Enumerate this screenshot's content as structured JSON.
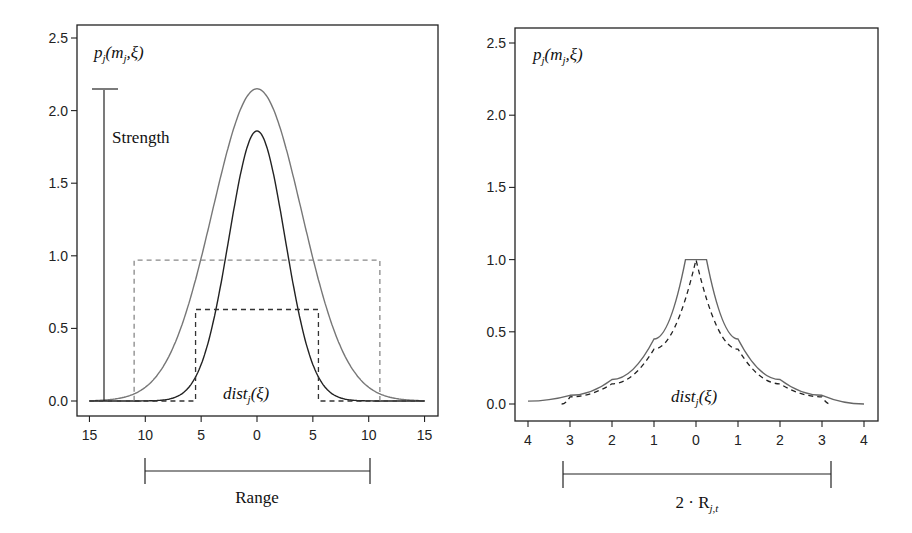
{
  "chart_data": [
    {
      "type": "line",
      "panel": "left",
      "title": "",
      "xlabel": "Range",
      "ylabel": "",
      "x_tick_labels": [
        "15",
        "10",
        "5",
        "0",
        "5",
        "10",
        "15"
      ],
      "x_ticks": [
        -15,
        -10,
        -5,
        0,
        5,
        10,
        15
      ],
      "y_tick_labels": [
        "0.0",
        "0.5",
        "1.0",
        "1.5",
        "2.0",
        "2.5"
      ],
      "y_ticks": [
        0.0,
        0.5,
        1.0,
        1.5,
        2.0,
        2.5
      ],
      "xlim": [
        -15,
        15
      ],
      "ylim": [
        -0.1,
        2.6
      ],
      "grid": false,
      "annotations": {
        "corner_label": "p_j(m_j,ξ)",
        "strength_label": "Strength",
        "strength_bar": {
          "x": -14,
          "y_from": 0.0,
          "y_to": 2.15
        },
        "dist_label": "dist_j(ξ)",
        "range_bracket": {
          "x_from": -10,
          "x_to": 10,
          "label": "Range"
        }
      },
      "series": [
        {
          "name": "wide gaussian (gray solid)",
          "style": "solid",
          "color": "#777777",
          "peak": 2.15,
          "sigma": 4.0,
          "x_range": [
            -15,
            15
          ]
        },
        {
          "name": "narrow gaussian (black solid)",
          "style": "solid",
          "color": "#222222",
          "peak": 1.86,
          "sigma": 2.5,
          "x_range": [
            -15,
            15
          ]
        },
        {
          "name": "wide box (gray dashed)",
          "style": "dashed",
          "color": "#888888",
          "height": 0.97,
          "x_from": -11,
          "x_to": 11
        },
        {
          "name": "narrow box (black dashed)",
          "style": "dashed",
          "color": "#333333",
          "height": 0.63,
          "x_from": -5.5,
          "x_to": 5.5
        }
      ]
    },
    {
      "type": "line",
      "panel": "right",
      "title": "",
      "xlabel": "2·R_j,t",
      "ylabel": "",
      "x_tick_labels": [
        "4",
        "3",
        "2",
        "1",
        "0",
        "1",
        "2",
        "3",
        "4"
      ],
      "x_ticks": [
        -4,
        -3,
        -2,
        -1,
        0,
        1,
        2,
        3,
        4
      ],
      "y_tick_labels": [
        "0.0",
        "0.5",
        "1.0",
        "1.5",
        "2.0",
        "2.5"
      ],
      "y_ticks": [
        0.0,
        0.5,
        1.0,
        1.5,
        2.0,
        2.5
      ],
      "xlim": [
        -4.1,
        4.1
      ],
      "ylim": [
        -0.1,
        2.6
      ],
      "grid": false,
      "annotations": {
        "corner_label": "p_j(m_j,ξ)",
        "dist_label": "dist_j(ξ)",
        "range_bracket": {
          "x_from": -3.2,
          "x_to": 3.2,
          "label": "2·R_j,t"
        }
      },
      "series": [
        {
          "name": "solid cusp (gray)",
          "style": "solid",
          "color": "#666666",
          "plateau": 1.0,
          "plateau_halfwidth": 0.25,
          "x_range": [
            -4,
            4
          ],
          "values_at": {
            "x": [
              -4,
              -3,
              -2,
              -1,
              -0.25,
              0,
              0.25,
              1,
              2,
              3,
              4
            ],
            "y": [
              0.02,
              0.06,
              0.17,
              0.45,
              1.0,
              1.0,
              1.0,
              0.45,
              0.17,
              0.06,
              0.0
            ]
          }
        },
        {
          "name": "dashed cusp (black)",
          "style": "dashed",
          "color": "#222222",
          "peak": 1.0,
          "x_range": [
            -3.2,
            3.2
          ],
          "values_at": {
            "x": [
              -3.2,
              -3,
              -2,
              -1,
              0,
              1,
              2,
              3,
              3.2
            ],
            "y": [
              0.0,
              0.05,
              0.14,
              0.38,
              1.0,
              0.38,
              0.14,
              0.05,
              0.0
            ]
          }
        }
      ]
    }
  ],
  "labels": {
    "left_corner": {
      "base": "p",
      "sub1": "j",
      "mid": "(m",
      "sub2": "j",
      "tail": ",ξ)"
    },
    "right_corner": {
      "base": "p",
      "sub1": "j",
      "mid": "(m",
      "sub2": "j",
      "tail": ",ξ)"
    },
    "strength": "Strength",
    "dist_left": {
      "base": "dist",
      "sub": "j",
      "tail": "(ξ)"
    },
    "dist_right": {
      "base": "dist",
      "sub": "j",
      "tail": "(ξ)"
    },
    "range": "Range",
    "two_r": {
      "base": "2 · R",
      "sub": "j,t"
    }
  }
}
